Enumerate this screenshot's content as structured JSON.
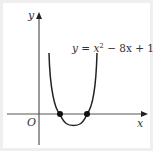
{
  "diagram": {
    "type": "function-graph",
    "equation": {
      "lhs": "y",
      "eq": " = ",
      "x": "x",
      "exp": "2",
      "rest": " − 8x + 15",
      "full": "y = x^2 − 8x + 15"
    },
    "axes": {
      "x_label": "x",
      "y_label": "y",
      "origin_label": "O"
    },
    "roots": [
      3,
      5
    ],
    "vertex": [
      4,
      -1
    ],
    "colors": {
      "curve": "#222222",
      "axis": "#555555",
      "points": "#111111",
      "background": "#ffffff",
      "border": "#efefef"
    }
  }
}
